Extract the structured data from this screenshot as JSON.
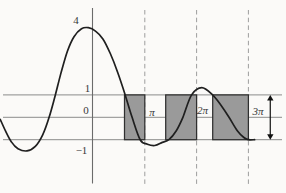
{
  "chart_data": {
    "type": "line",
    "title": "",
    "xlabel": "",
    "ylabel": "",
    "xlim_rad": [
      -5.64,
      11.7
    ],
    "ylim": [
      -3.4,
      5.2
    ],
    "grid": "partial",
    "x_ticks": [
      {
        "label": "π",
        "value": 3.1416
      },
      {
        "label": "2π",
        "value": 6.2832
      },
      {
        "label": "3π",
        "value": 9.4248
      }
    ],
    "y_ticks": [
      {
        "label": "4",
        "value": 4
      },
      {
        "label": "1",
        "value": 1
      },
      {
        "label": "0",
        "value": 0
      },
      {
        "label": "−1",
        "value": -1
      }
    ],
    "hlines": [
      1,
      0,
      -1
    ],
    "dashed_vlines": [
      3.1416,
      6.2832,
      9.4248
    ],
    "curve": [
      [
        -5.62,
        -0.1
      ],
      [
        -5.3,
        -0.62
      ],
      [
        -4.95,
        -1.1
      ],
      [
        -4.55,
        -1.4
      ],
      [
        -4.0,
        -1.5
      ],
      [
        -3.5,
        -1.3
      ],
      [
        -3.05,
        -0.78
      ],
      [
        -2.66,
        0.0
      ],
      [
        -2.3,
        0.95
      ],
      [
        -1.95,
        1.95
      ],
      [
        -1.55,
        2.95
      ],
      [
        -1.15,
        3.6
      ],
      [
        -0.7,
        3.95
      ],
      [
        -0.28,
        4.0
      ],
      [
        0.15,
        3.85
      ],
      [
        0.6,
        3.5
      ],
      [
        1.05,
        2.85
      ],
      [
        1.5,
        2.0
      ],
      [
        1.95,
        1.0
      ],
      [
        2.37,
        0.0
      ],
      [
        2.86,
        -1.0
      ],
      [
        3.3,
        -1.2
      ],
      [
        3.75,
        -1.26
      ],
      [
        4.2,
        -1.12
      ],
      [
        4.6,
        -1.0
      ],
      [
        5.05,
        -0.6
      ],
      [
        5.45,
        0.0
      ],
      [
        5.98,
        1.0
      ],
      [
        6.6,
        1.32
      ],
      [
        7.25,
        1.0
      ],
      [
        7.75,
        0.55
      ],
      [
        8.25,
        0.0
      ],
      [
        8.75,
        -0.6
      ],
      [
        9.15,
        -0.9
      ],
      [
        9.42,
        -1.0
      ],
      [
        9.8,
        -1.0
      ]
    ],
    "shaded_rects": [
      {
        "x0": 1.91,
        "x1": 3.1416,
        "y0": -1,
        "y1": 1
      },
      {
        "x0": 4.41,
        "x1": 6.2832,
        "y0": -1,
        "y1": 1
      },
      {
        "x0": 7.26,
        "x1": 9.4248,
        "y0": -1,
        "y1": 1
      }
    ],
    "arrow": {
      "x": 10.75,
      "y0": 1,
      "y1": -1
    },
    "colors": {
      "background": "#fbfaf8",
      "curve": "#1f1f1f",
      "grid": "#7f7f7f",
      "dashed": "#9d9d9d",
      "rect_fill": "#9a9a9a",
      "rect_border": "#2f2f2f",
      "axis": "#6b6b6b",
      "text": "#383838",
      "arrow": "#111111"
    }
  }
}
